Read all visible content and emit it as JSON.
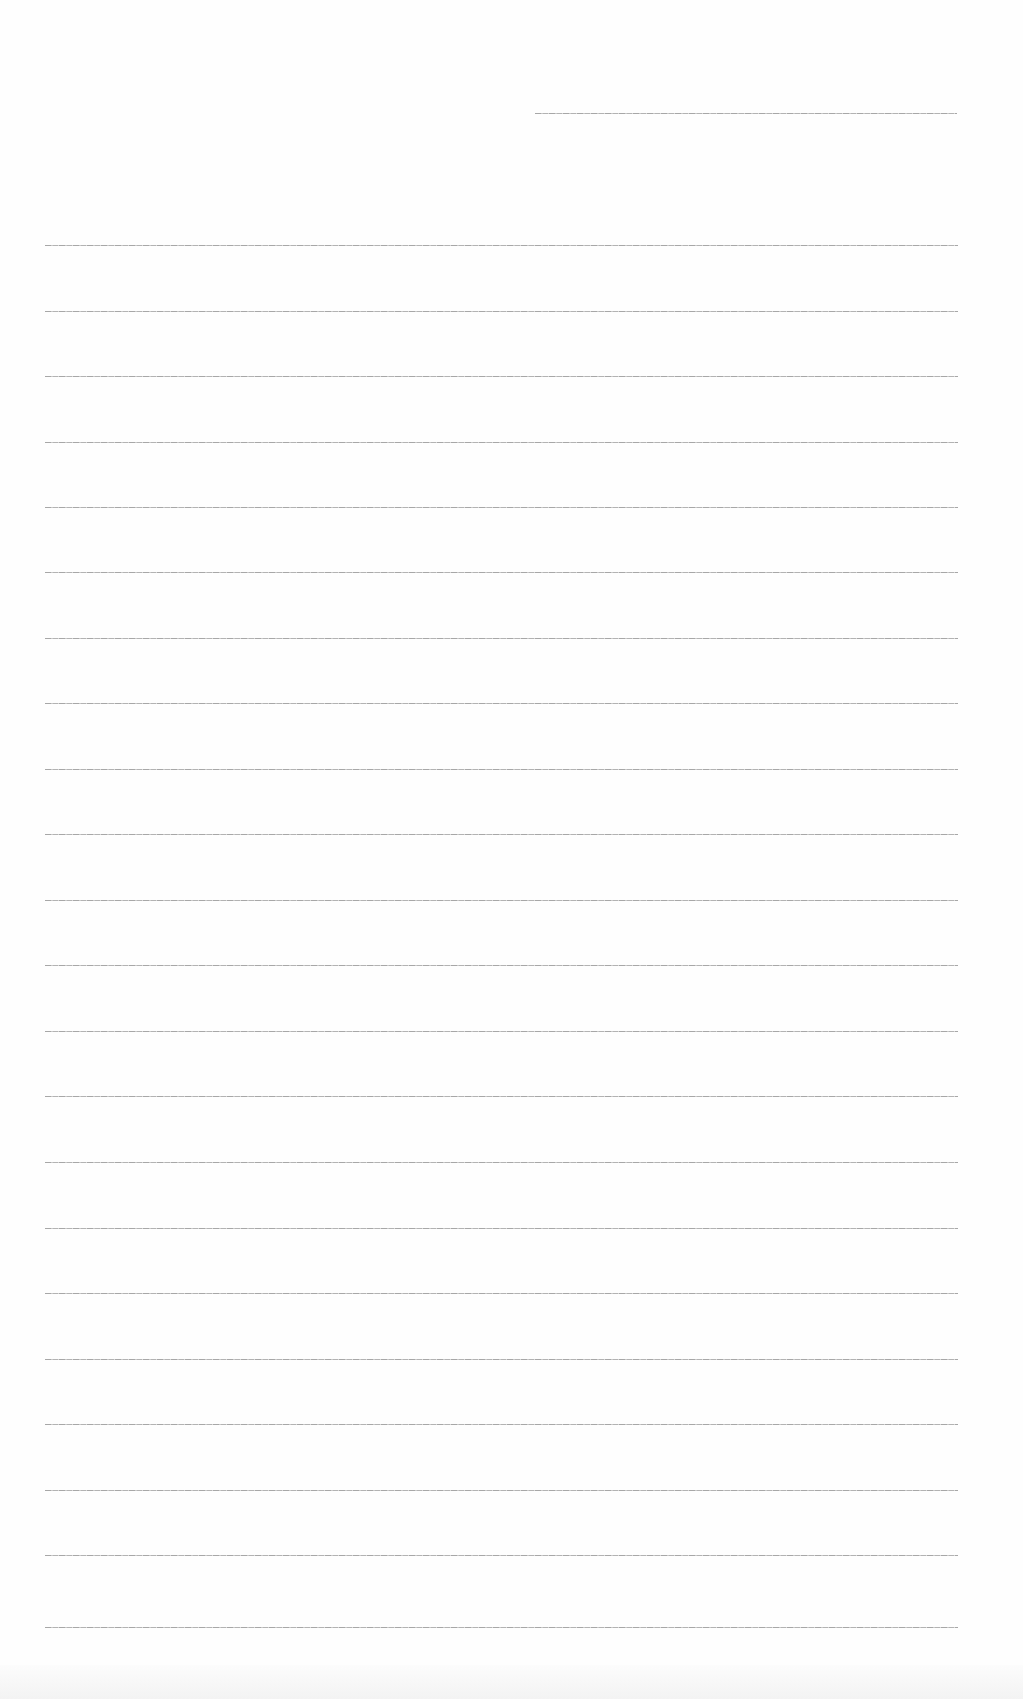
{
  "document": {
    "type": "blank ruled paper",
    "rule_color": "#8a8a8a",
    "background_color": "#fefefe",
    "header_line": {
      "x1": 535,
      "x2": 957,
      "y": 113
    },
    "body_lines": {
      "x1": 45,
      "x2": 958,
      "y_positions": [
        245,
        311,
        376,
        442,
        507,
        572,
        638,
        703,
        769,
        834,
        900,
        965,
        1031,
        1096,
        1162,
        1228,
        1293,
        1359,
        1424,
        1490,
        1555,
        1627
      ]
    }
  }
}
